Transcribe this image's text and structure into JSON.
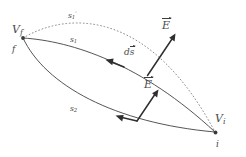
{
  "figure": {
    "background_color": "#ffffff",
    "stroke_color": "#4a4a4a",
    "label_color": "#4a4a4a",
    "width": 246,
    "height": 157,
    "labels": {
      "potential_final": "V",
      "potential_final_sub": "f",
      "potential_initial": "V",
      "potential_initial_sub": "i",
      "point_final": "f",
      "point_initial": "i",
      "path_one": "s",
      "path_one_sub": "1",
      "path_one_prime": "s",
      "path_one_prime_sub": "1",
      "path_one_prime_mark": "′",
      "path_two": "s",
      "path_two_sub": "2",
      "displacement_element": "d",
      "displacement_element_vec": "s",
      "field_upper": "E",
      "field_lower": "E"
    },
    "geometry": {
      "vertex_final": [
        22,
        38
      ],
      "vertex_initial": [
        216,
        133
      ],
      "curve_upper_solid": "M22,38 C70,40 140,62 216,133",
      "curve_lower_solid": "M22,38 C44,84 112,122 216,133",
      "curve_dotted": "M22,38 C80,10 150,14 216,133",
      "arrow_ds": {
        "from": [
          123,
          66
        ],
        "to": [
          106,
          60
        ]
      },
      "arrow_field_upper": {
        "from": [
          148,
          75
        ],
        "to": [
          176,
          34
        ]
      },
      "arrow_field_lower": {
        "from": [
          110,
          121
        ],
        "to": [
          134,
          118
        ]
      },
      "arrow_field_lower_e": {
        "from": [
          137,
          120
        ],
        "to": [
          158,
          91
        ]
      },
      "arrow_ds_lower": {
        "from": [
          130,
          120
        ],
        "to": [
          113,
          114
        ]
      }
    }
  }
}
